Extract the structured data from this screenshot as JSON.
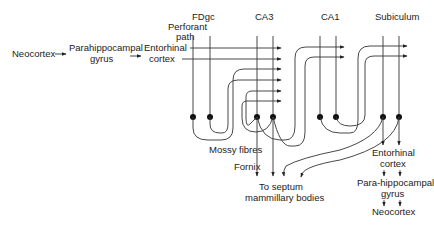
{
  "diagram": {
    "labels": {
      "neocortex_in": "Neocortex",
      "parahippocampal_in_1": "Parahippocampal",
      "parahippocampal_in_2": "gyrus",
      "entorhinal_in_1": "Entorhinal",
      "entorhinal_in_2": "cortex",
      "perforant_1": "Perforant",
      "perforant_2": "path",
      "fdgc": "FDgc",
      "ca3": "CA3",
      "ca1": "CA1",
      "subiculum": "Subiculum",
      "mossy": "Mossy fibres",
      "fornix": "Fornix",
      "septum_1": "To septum",
      "septum_2": "mammillary bodies",
      "entorhinal_out_1": "Entorhinal",
      "entorhinal_out_2": "cortex",
      "parahippocampal_out_1": "Para-hippocampal",
      "parahippocampal_out_2": "gyrus",
      "neocortex_out": "Neocortex"
    },
    "nodes": [
      "FDgc",
      "CA3",
      "CA1",
      "Subiculum"
    ],
    "edges": [
      {
        "from": "Neocortex",
        "to": "Parahippocampal gyrus"
      },
      {
        "from": "Parahippocampal gyrus",
        "to": "Entorhinal cortex"
      },
      {
        "from": "Entorhinal cortex",
        "to": "FDgc",
        "via": "Perforant path"
      },
      {
        "from": "Entorhinal cortex",
        "to": "CA3",
        "via": "Perforant path"
      },
      {
        "from": "FDgc",
        "to": "CA3",
        "via": "Mossy fibres"
      },
      {
        "from": "CA3",
        "to": "CA3",
        "via": "recurrent collaterals"
      },
      {
        "from": "CA3",
        "to": "CA1"
      },
      {
        "from": "CA1",
        "to": "Subiculum"
      },
      {
        "from": "CA3",
        "to": "To septum mammillary bodies",
        "via": "Fornix"
      },
      {
        "from": "Subiculum",
        "to": "To septum mammillary bodies"
      },
      {
        "from": "Subiculum",
        "to": "Entorhinal cortex"
      },
      {
        "from": "Entorhinal cortex",
        "to": "Para-hippocampal gyrus"
      },
      {
        "from": "Para-hippocampal gyrus",
        "to": "Neocortex"
      }
    ]
  }
}
